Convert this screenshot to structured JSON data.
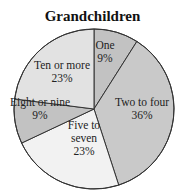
{
  "chart_data": {
    "type": "pie",
    "title": "Grandchildren",
    "categories": [
      "One",
      "Two to four",
      "Five to seven",
      "Eight or nine",
      "Ten or more"
    ],
    "values": [
      9,
      36,
      23,
      9,
      23
    ],
    "unit": "%",
    "labels": [
      {
        "name": "One",
        "pct": "9%"
      },
      {
        "name": "Two to four",
        "pct": "36%"
      },
      {
        "name": [
          "Five to",
          "seven"
        ],
        "pct": "23%"
      },
      {
        "name": "Eight or nine",
        "pct": "9%"
      },
      {
        "name": "Ten or more",
        "pct": "23%"
      }
    ],
    "colors": [
      "#c2c2c2",
      "#c9c9c9",
      "#f2f2f2",
      "#c2c2c2",
      "#e2e2e2"
    ],
    "start_angle_deg": 0,
    "direction": "clockwise",
    "legend": "none"
  }
}
